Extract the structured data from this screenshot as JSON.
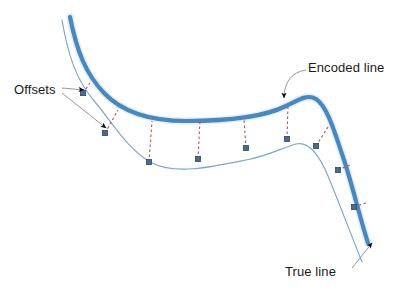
{
  "figure": {
    "background_color": "#ffffff",
    "width": 406,
    "height": 293
  },
  "colors": {
    "encoded_line": "#4a87bd",
    "encoded_line_halo": "#bcd6ec",
    "true_line": "#7ba7cc",
    "offset_dash": "#c0504d",
    "marker_fill": "#4a6b8a",
    "marker_stroke": "#2f4a63",
    "leader_line": "#8c8c8c",
    "label_text": "#1a1a1a"
  },
  "labels": {
    "offsets": "Offsets",
    "encoded_line": "Encoded line",
    "true_line": "True line"
  },
  "legend_semantics": {
    "encoded_line_description": "Thick smooth blue curve representing the encoded (generalized) line",
    "true_line_description": "Thin blue curve with square vertex markers representing the true line",
    "offsets_description": "Red dashed segments connecting true line vertices to the encoded line"
  },
  "geometry": {
    "encoded_line_path": "M 70,17 C 77,52 86,74 104,93 C 124,114 152,121 186,121 C 222,121 262,118 286,106 C 300,99 308,94 316,99 C 327,106 334,130 344,160 C 352,184 360,218 368,243",
    "true_line_path": "M 62,20 C 68,55 76,80 95,102 C 112,122 128,150 152,163 C 176,175 212,167 246,160 C 268,156 284,147 296,144 C 308,141 318,152 328,176 C 338,200 350,232 362,262",
    "markers": [
      {
        "id": "m1",
        "x": 83,
        "y": 93
      },
      {
        "id": "m2",
        "x": 105,
        "y": 133
      },
      {
        "id": "m3",
        "x": 149,
        "y": 162
      },
      {
        "id": "m4",
        "x": 198,
        "y": 159
      },
      {
        "id": "m5",
        "x": 246,
        "y": 148
      },
      {
        "id": "m6",
        "x": 287,
        "y": 139
      },
      {
        "id": "m7",
        "x": 316,
        "y": 146
      },
      {
        "id": "m8",
        "x": 338,
        "y": 170
      },
      {
        "id": "m9",
        "x": 354,
        "y": 207
      }
    ],
    "offsets": [
      {
        "id": "o1",
        "x1": 83,
        "y1": 93,
        "x2": 90,
        "y2": 83
      },
      {
        "id": "o2",
        "x1": 105,
        "y1": 133,
        "x2": 118,
        "y2": 110
      },
      {
        "id": "o3",
        "x1": 149,
        "y1": 162,
        "x2": 152,
        "y2": 121
      },
      {
        "id": "o4",
        "x1": 198,
        "y1": 159,
        "x2": 200,
        "y2": 120
      },
      {
        "id": "o5",
        "x1": 246,
        "y1": 148,
        "x2": 244,
        "y2": 119
      },
      {
        "id": "o6",
        "x1": 287,
        "y1": 139,
        "x2": 288,
        "y2": 104
      },
      {
        "id": "o7",
        "x1": 316,
        "y1": 146,
        "x2": 328,
        "y2": 127
      },
      {
        "id": "o8",
        "x1": 338,
        "y1": 170,
        "x2": 350,
        "y2": 165
      },
      {
        "id": "o9",
        "x1": 354,
        "y1": 207,
        "x2": 366,
        "y2": 203
      }
    ],
    "leaders": {
      "offsets_leader_a": {
        "path": "M 62,88 L 84,90",
        "tip_x": 84,
        "tip_y": 90,
        "tip_angle": 5
      },
      "offsets_leader_b": {
        "path": "M 62,93 L 106,128",
        "tip_x": 106,
        "tip_y": 128,
        "tip_angle": 38
      },
      "encoded_leader": {
        "path": "M 306,70 C 292,72 284,82 284,98",
        "tip_x": 284,
        "tip_y": 101,
        "tip_angle": 90
      },
      "true_leader": {
        "path": "M 352,268 L 372,243",
        "tip_x": 372,
        "tip_y": 243,
        "tip_angle": -52
      }
    },
    "label_positions": {
      "offsets": {
        "x": 14,
        "y": 94,
        "anchor": "start"
      },
      "encoded_line": {
        "x": 308,
        "y": 72,
        "anchor": "start"
      },
      "true_line": {
        "x": 285,
        "y": 276,
        "anchor": "start"
      }
    }
  }
}
